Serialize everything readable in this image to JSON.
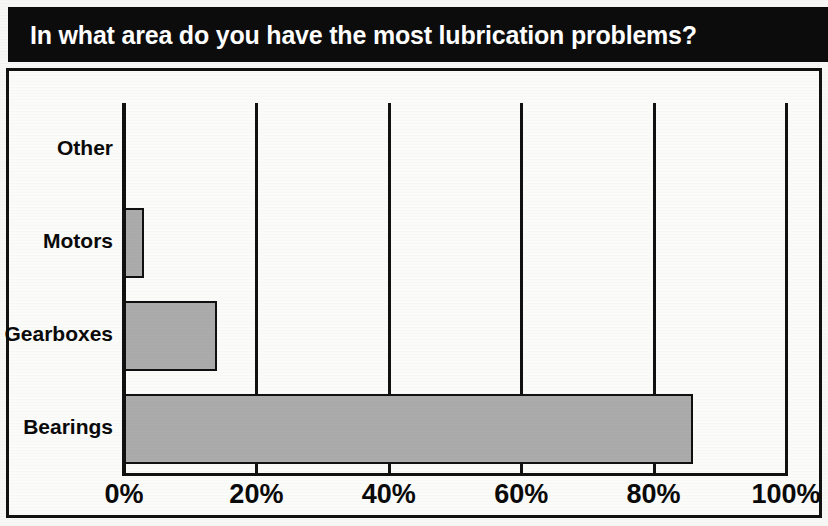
{
  "title": "In what area do you have the most lubrication problems?",
  "colors": {
    "banner_background": "#0c0c0c",
    "banner_text": "#ffffff",
    "bar_fill": "#ababab",
    "bar_outline": "#101010",
    "frame": "#111111",
    "page_background": "#fbfbf9"
  },
  "axis": {
    "ticks": [
      {
        "label": "0%",
        "value": 0
      },
      {
        "label": "20%",
        "value": 20
      },
      {
        "label": "40%",
        "value": 40
      },
      {
        "label": "60%",
        "value": 60
      },
      {
        "label": "80%",
        "value": 80
      },
      {
        "label": "100%",
        "value": 100
      }
    ]
  },
  "categories": [
    {
      "label": "Other"
    },
    {
      "label": "Motors"
    },
    {
      "label": "Gearboxes"
    },
    {
      "label": "Bearings"
    }
  ],
  "chart_data": {
    "type": "bar",
    "orientation": "horizontal",
    "title": "In what area do you have the most lubrication problems?",
    "categories": [
      "Other",
      "Motors",
      "Gearboxes",
      "Bearings"
    ],
    "values": [
      0,
      3,
      14,
      86
    ],
    "value_unit": "percent",
    "xlabel": "",
    "ylabel": "",
    "xlim": [
      0,
      100
    ],
    "xticks": [
      0,
      20,
      40,
      60,
      80,
      100
    ],
    "xticklabels": [
      "0%",
      "20%",
      "40%",
      "60%",
      "80%",
      "100%"
    ],
    "grid": "vertical",
    "legend": "none",
    "series": [
      {
        "name": "Share of respondents",
        "values": [
          0,
          3,
          14,
          86
        ]
      }
    ]
  }
}
